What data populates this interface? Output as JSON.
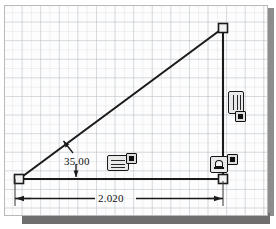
{
  "app": {
    "title": "CAD Sketch Canvas",
    "background_color": "#ffffff",
    "canvas_color": "#fdfdfd",
    "grid_color": "#b9c0c8",
    "geometry_color": "#1a1a1a",
    "dimension_color": "#111111"
  },
  "sketch": {
    "shape": "right-triangle",
    "vertices": {
      "origin": {
        "x": 14,
        "y": 173,
        "marker": "square"
      },
      "top_right": {
        "x": 218,
        "y": 22,
        "marker": "square"
      },
      "bottom_right": {
        "x": 218,
        "y": 173,
        "marker": "square"
      }
    },
    "segments": [
      {
        "name": "hypotenuse",
        "from": "origin",
        "to": "top_right"
      },
      {
        "name": "vertical-line",
        "from": "top_right",
        "to": "bottom_right"
      },
      {
        "name": "horizontal-line",
        "from": "origin",
        "to": "bottom_right"
      }
    ]
  },
  "dimensions": {
    "angle": {
      "value": "35.00",
      "label": "35.00",
      "type": "angular",
      "units": "degrees",
      "between": [
        "horizontal-line",
        "hypotenuse"
      ]
    },
    "length": {
      "value": "2.020",
      "label": "2.020",
      "type": "linear",
      "units": "inches",
      "applies_to": "horizontal-line"
    }
  },
  "relations": [
    {
      "id": "vertical-relation",
      "icon": "vertical-relation-icon",
      "label": "Vertical",
      "has_delete_badge": true,
      "badge_icon": "delete-relation-badge-icon",
      "position": {
        "x": 226,
        "y": 90
      }
    },
    {
      "id": "horizontal-relation",
      "icon": "horizontal-relation-icon",
      "label": "Horizontal",
      "has_delete_badge": true,
      "badge_icon": "delete-relation-badge-icon",
      "position": {
        "x": 106,
        "y": 150
      }
    },
    {
      "id": "coincident-relation",
      "icon": "coincident-relation-icon",
      "label": "Coincident",
      "has_delete_badge": true,
      "badge_icon": "delete-relation-badge-icon",
      "position": {
        "x": 209,
        "y": 151
      }
    }
  ]
}
